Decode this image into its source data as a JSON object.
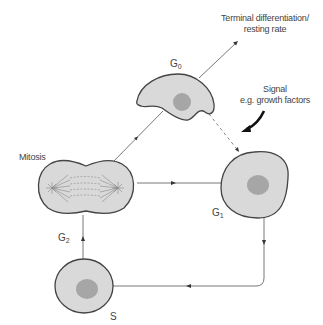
{
  "diagram": {
    "colors": {
      "cell_fill": "#d9d9d9",
      "nucleus_fill": "#a6a6a6",
      "stroke": "#444444",
      "line": "#555555"
    },
    "nodes": [
      {
        "id": "g0",
        "label": "G",
        "sub": "0",
        "shape": "crescent cell with nucleus"
      },
      {
        "id": "g1",
        "label": "G",
        "sub": "1",
        "shape": "round cell with nucleus"
      },
      {
        "id": "s",
        "label": "S",
        "sub": "",
        "shape": "round cell with nucleus"
      },
      {
        "id": "g2",
        "label": "G",
        "sub": "2",
        "shape": "arrow label"
      },
      {
        "id": "mitosis",
        "label": "Mitosis",
        "shape": "dividing cell with spindle"
      }
    ],
    "annotations": {
      "terminal_line1": "Terminal differentiation/",
      "terminal_line2": "resting rate",
      "signal_line1": "Signal",
      "signal_line2": "e.g. growth factors"
    },
    "edges": [
      {
        "from": "mitosis",
        "to": "g0",
        "style": "solid"
      },
      {
        "from": "g0",
        "to": "terminal differentiation",
        "style": "solid"
      },
      {
        "from": "g0",
        "to": "g1",
        "style": "dashed"
      },
      {
        "from": "mitosis",
        "to": "g1",
        "style": "solid"
      },
      {
        "from": "g1",
        "to": "s",
        "style": "solid"
      },
      {
        "from": "s",
        "to": "mitosis",
        "style": "solid",
        "label": "G2"
      },
      {
        "from": "signal",
        "to": "g0-g1 transition",
        "style": "bold curved"
      }
    ]
  }
}
